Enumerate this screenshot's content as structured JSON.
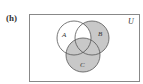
{
  "figure": {
    "label": "(h)",
    "universe_label": "U",
    "sets": [
      {
        "name": "A",
        "cx": 74,
        "cy": 38,
        "r": 17
      },
      {
        "name": "B",
        "cx": 92,
        "cy": 38,
        "r": 17
      },
      {
        "name": "C",
        "cx": 83,
        "cy": 55,
        "r": 17
      }
    ],
    "shaded_regions": [
      "B only",
      "C only",
      "A∩C only",
      "B∩C only",
      "A∩B∩C"
    ],
    "unshaded_regions": [
      "A only",
      "A∩B only",
      "outside"
    ],
    "colors": {
      "shade": "#c8c8c8",
      "stroke": "#555555",
      "frame": "#888888",
      "background": "#ffffff"
    }
  }
}
